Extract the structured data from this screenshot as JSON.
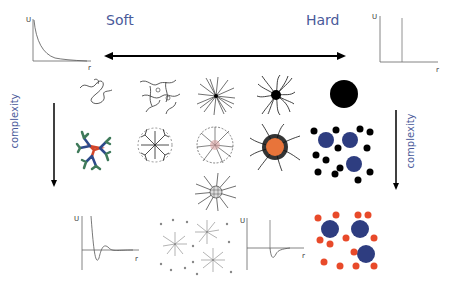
{
  "labels": {
    "soft": "Soft",
    "hard": "Hard",
    "complexity_left": "complexity",
    "complexity_right": "complexity"
  },
  "plots": {
    "soft_potential": {
      "y_axis": "U",
      "x_axis": "r",
      "shape": "exponential decay"
    },
    "hard_potential": {
      "y_axis": "U",
      "x_axis": "r",
      "shape": "hard wall"
    },
    "oscillatory_potential": {
      "y_axis": "U",
      "x_axis": "r",
      "shape": "damped oscillation"
    },
    "depletion_potential": {
      "y_axis": "U",
      "x_axis": "r",
      "shape": "hard wall with attractive well"
    }
  },
  "colors": {
    "text_blue": "#4a5a9a",
    "orange": "#e8743a",
    "navy": "#2e3d80",
    "red_small": "#e84a2a",
    "dendrimer_green": "#3f7a5a",
    "dendrimer_blue": "#2d4a8a",
    "dendrimer_red": "#d2462a"
  },
  "rows": {
    "row1": [
      "linear polymer coil",
      "polymer network",
      "star polymer",
      "dense star / micelle",
      "hard sphere"
    ],
    "row2": [
      "dendrimer",
      "hyperbranched polymer",
      "microgel",
      "grafted colloid",
      "colloid-polymer mixture"
    ],
    "row3": [
      "star with grid core"
    ],
    "bottom": [
      "star-polymer mixture",
      "binary colloid mixture"
    ]
  }
}
